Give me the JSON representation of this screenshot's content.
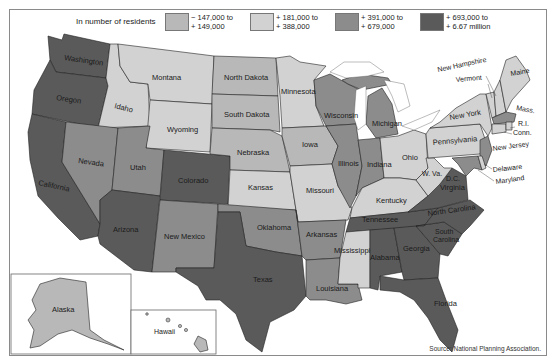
{
  "legend": {
    "title": "In number of residents",
    "items": [
      {
        "line1": "− 147,000 to",
        "line2": "+ 149,000",
        "color": "#b8b8b8",
        "category": "c1"
      },
      {
        "line1": "+ 181,000 to",
        "line2": "+ 388,000",
        "color": "#d2d2d2",
        "category": "c2"
      },
      {
        "line1": "+ 391,000 to",
        "line2": "+ 679,000",
        "color": "#8c8c8c",
        "category": "c3"
      },
      {
        "line1": "+ 693,000 to",
        "line2": "+ 6.67 million",
        "color": "#5a5a5a",
        "category": "c4"
      }
    ]
  },
  "states": [
    {
      "name": "Washington",
      "category": "c4"
    },
    {
      "name": "Oregon",
      "category": "c4"
    },
    {
      "name": "California",
      "category": "c4"
    },
    {
      "name": "Idaho",
      "category": "c2"
    },
    {
      "name": "Nevada",
      "category": "c3"
    },
    {
      "name": "Montana",
      "category": "c2"
    },
    {
      "name": "Wyoming",
      "category": "c2"
    },
    {
      "name": "Utah",
      "category": "c3"
    },
    {
      "name": "Arizona",
      "category": "c4"
    },
    {
      "name": "Colorado",
      "category": "c4"
    },
    {
      "name": "New Mexico",
      "category": "c3"
    },
    {
      "name": "North Dakota",
      "category": "c1"
    },
    {
      "name": "South Dakota",
      "category": "c1"
    },
    {
      "name": "Nebraska",
      "category": "c1"
    },
    {
      "name": "Kansas",
      "category": "c2"
    },
    {
      "name": "Oklahoma",
      "category": "c3"
    },
    {
      "name": "Texas",
      "category": "c4"
    },
    {
      "name": "Minnesota",
      "category": "c2"
    },
    {
      "name": "Iowa",
      "category": "c1"
    },
    {
      "name": "Missouri",
      "category": "c2"
    },
    {
      "name": "Arkansas",
      "category": "c3"
    },
    {
      "name": "Louisiana",
      "category": "c3"
    },
    {
      "name": "Wisconsin",
      "category": "c3"
    },
    {
      "name": "Illinois",
      "category": "c3"
    },
    {
      "name": "Michigan",
      "category": "c3"
    },
    {
      "name": "Indiana",
      "category": "c3"
    },
    {
      "name": "Ohio",
      "category": "c2"
    },
    {
      "name": "Kentucky",
      "category": "c2"
    },
    {
      "name": "Tennessee",
      "category": "c4"
    },
    {
      "name": "Mississippi",
      "category": "c2"
    },
    {
      "name": "Alabama",
      "category": "c4"
    },
    {
      "name": "Georgia",
      "category": "c4"
    },
    {
      "name": "Florida",
      "category": "c4"
    },
    {
      "name": "South Carolina",
      "category": "c4"
    },
    {
      "name": "North Carolina",
      "category": "c4"
    },
    {
      "name": "Virginia",
      "category": "c4"
    },
    {
      "name": "W. Va.",
      "category": "c2"
    },
    {
      "name": "Pennsylvania",
      "category": "c2"
    },
    {
      "name": "New York",
      "category": "c2"
    },
    {
      "name": "Vermont",
      "category": "c2"
    },
    {
      "name": "New Hampshire",
      "category": "c2"
    },
    {
      "name": "Maine",
      "category": "c2"
    },
    {
      "name": "Mass.",
      "category": "c3"
    },
    {
      "name": "R.I.",
      "category": "c2"
    },
    {
      "name": "Conn.",
      "category": "c2"
    },
    {
      "name": "New Jersey",
      "category": "c3"
    },
    {
      "name": "Delaware",
      "category": "c2"
    },
    {
      "name": "Maryland",
      "category": "c3"
    },
    {
      "name": "D.C.",
      "category": "c4"
    },
    {
      "name": "Alaska",
      "category": "c2"
    },
    {
      "name": "Hawaii",
      "category": "c2"
    }
  ],
  "labels": {
    "washington": "Washington",
    "oregon": "Oregon",
    "california": "California",
    "idaho": "Idaho",
    "nevada": "Nevada",
    "montana": "Montana",
    "wyoming": "Wyoming",
    "utah": "Utah",
    "arizona": "Arizona",
    "colorado": "Colorado",
    "new_mexico": "New Mexico",
    "north_dakota": "North Dakota",
    "south_dakota": "South Dakota",
    "nebraska": "Nebraska",
    "kansas": "Kansas",
    "oklahoma": "Oklahoma",
    "texas": "Texas",
    "minnesota": "Minnesota",
    "iowa": "Iowa",
    "missouri": "Missouri",
    "arkansas": "Arkansas",
    "louisiana": "Louisiana",
    "wisconsin": "Wisconsin",
    "illinois": "Illinois",
    "michigan": "Michigan",
    "indiana": "Indiana",
    "ohio": "Ohio",
    "kentucky": "Kentucky",
    "tennessee": "Tennessee",
    "mississippi": "Mississippi",
    "alabama": "Alabama",
    "georgia": "Georgia",
    "florida": "Florida",
    "south_carolina_1": "South",
    "south_carolina_2": "Carolina",
    "north_carolina": "North Carolina",
    "virginia": "Virginia",
    "wva": "W. Va.",
    "dc": "D.C.",
    "pennsylvania": "Pennsylvania",
    "new_york": "New York",
    "vermont": "Vermont",
    "new_hampshire": "New Hampshire",
    "maine": "Maine",
    "mass": "Mass.",
    "ri": "R.I.",
    "conn": "Conn.",
    "new_jersey": "New Jersey",
    "delaware": "Delaware",
    "maryland": "Maryland",
    "alaska": "Alaska",
    "hawaii": "Hawaii"
  },
  "source": "Source: National Planning Association."
}
